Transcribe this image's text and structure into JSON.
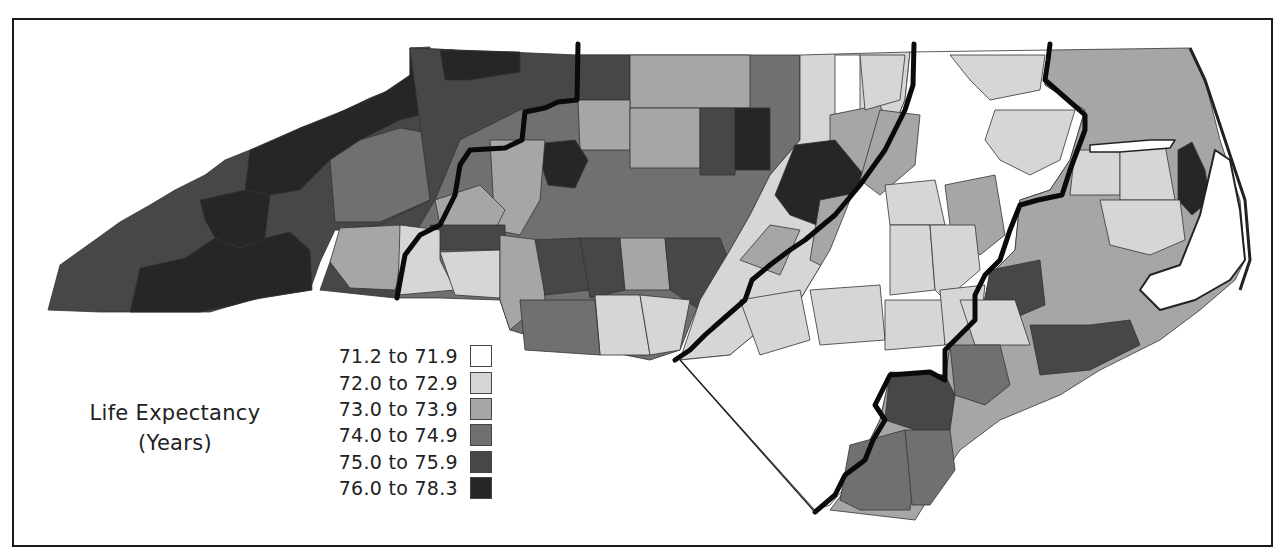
{
  "map": {
    "subject": "North Carolina counties",
    "legend": {
      "title_line1": "Life Expectancy",
      "title_line2": "(Years)",
      "classes": [
        {
          "label": "71.2 to 71.9",
          "color": "#ffffff"
        },
        {
          "label": "72.0 to 72.9",
          "color": "#d6d6d6"
        },
        {
          "label": "73.0 to 73.9",
          "color": "#a6a6a6"
        },
        {
          "label": "74.0 to 74.9",
          "color": "#707070"
        },
        {
          "label": "75.0 to 75.9",
          "color": "#474747"
        },
        {
          "label": "76.0 to 78.3",
          "color": "#262626"
        }
      ]
    },
    "regions": [
      {
        "name": "Mountains",
        "dominant_class": "76.0 to 78.3"
      },
      {
        "name": "Foothills/Western Piedmont",
        "dominant_class": "75.0 to 75.9"
      },
      {
        "name": "Central Piedmont",
        "dominant_class": "74.0 to 74.9"
      },
      {
        "name": "Eastern Piedmont",
        "dominant_class": "72.0 to 72.9"
      },
      {
        "name": "Inner Coastal Plain",
        "dominant_class": "71.2 to 71.9"
      },
      {
        "name": "Coastal",
        "dominant_class": "73.0 to 73.9"
      }
    ]
  }
}
